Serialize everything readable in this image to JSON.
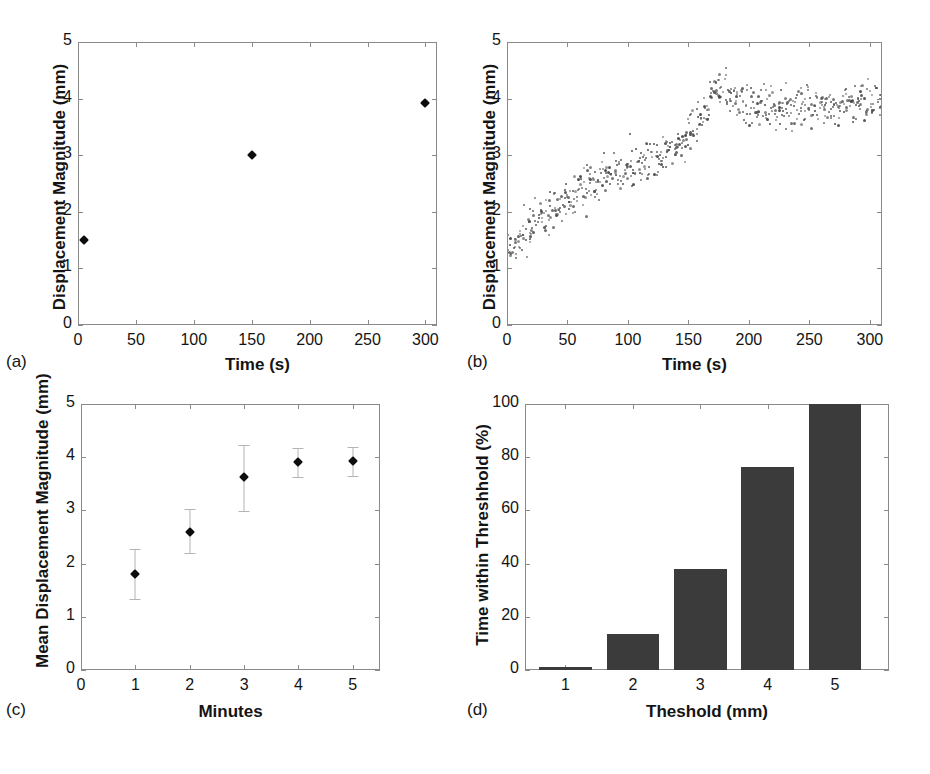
{
  "figure": {
    "width": 930,
    "height": 774,
    "background": "#ffffff",
    "marker_color": "#0d0d0d",
    "errorbar_color": "#b4b4b4",
    "bar_color": "#3b3b3b",
    "axis_color": "#8a8a8a",
    "scatter_color": "#4a4a4a"
  },
  "panels": {
    "a": {
      "letter": "(a)",
      "xlabel": "Time (s)",
      "ylabel": "Displacement Magnitude (mm)",
      "xticks": [
        "0",
        "50",
        "100",
        "150",
        "200",
        "250",
        "300"
      ],
      "yticks": [
        "0",
        "1",
        "2",
        "3",
        "4",
        "5"
      ]
    },
    "b": {
      "letter": "(b)",
      "xlabel": "Time (s)",
      "ylabel": "Displacement Magnitude (mm)",
      "xticks": [
        "0",
        "50",
        "100",
        "150",
        "200",
        "250",
        "300"
      ],
      "yticks": [
        "0",
        "1",
        "2",
        "3",
        "4",
        "5"
      ]
    },
    "c": {
      "letter": "(c)",
      "xlabel": "Minutes",
      "ylabel": "Mean Displacement Magnitude (mm)",
      "xticks": [
        "0",
        "1",
        "2",
        "3",
        "4",
        "5"
      ],
      "yticks": [
        "0",
        "1",
        "2",
        "3",
        "4",
        "5"
      ]
    },
    "d": {
      "letter": "(d)",
      "xlabel": "Theshold (mm)",
      "ylabel": "Time within Threshhold (%)",
      "xticks": [
        "1",
        "2",
        "3",
        "4",
        "5"
      ],
      "yticks": [
        "0",
        "20",
        "40",
        "60",
        "80",
        "100"
      ]
    }
  },
  "chart_data": [
    {
      "id": "a",
      "type": "scatter",
      "title": "",
      "xlabel": "Time (s)",
      "ylabel": "Displacement Magnitude (mm)",
      "xlim": [
        0,
        310
      ],
      "ylim": [
        0,
        5
      ],
      "xticks": [
        0,
        50,
        100,
        150,
        200,
        250,
        300
      ],
      "yticks": [
        0,
        1,
        2,
        3,
        4,
        5
      ],
      "grid": false,
      "legend": null,
      "x": [
        5,
        150,
        300
      ],
      "y": [
        1.5,
        3.01,
        3.92
      ]
    },
    {
      "id": "b",
      "type": "scatter",
      "title": "",
      "xlabel": "Time (s)",
      "ylabel": "Displacement Magnitude (mm)",
      "xlim": [
        0,
        310
      ],
      "ylim": [
        0,
        5
      ],
      "xticks": [
        0,
        50,
        100,
        150,
        200,
        250,
        300
      ],
      "yticks": [
        0,
        1,
        2,
        3,
        4,
        5
      ],
      "grid": false,
      "legend": null,
      "description": "Dense point cloud of per-frame displacement; rises roughly linearly from about 1.4 mm at t=0 to a peak near 4.3 mm at t~170 s, then plateaus in a noisy band between about 3.4 and 4.4 mm out to t~305 s. A few low outliers near 0.3-1.0 mm appear at t<20 s.",
      "trend_x": [
        0,
        20,
        40,
        60,
        80,
        100,
        120,
        140,
        160,
        170,
        180,
        200,
        220,
        240,
        260,
        280,
        305
      ],
      "trend_y": [
        1.45,
        1.8,
        2.1,
        2.45,
        2.6,
        2.8,
        3.0,
        3.2,
        3.6,
        4.3,
        4.15,
        3.85,
        3.9,
        3.85,
        3.9,
        3.95,
        4.0
      ],
      "spread": [
        0.45,
        0.35,
        0.35,
        0.38,
        0.35,
        0.33,
        0.33,
        0.33,
        0.35,
        0.32,
        0.35,
        0.4,
        0.4,
        0.4,
        0.38,
        0.38,
        0.35
      ],
      "n_points": 620
    },
    {
      "id": "c",
      "type": "scatter",
      "title": "",
      "xlabel": "Minutes",
      "ylabel": "Mean Displacement Magnitude (mm)",
      "xlim": [
        0,
        5.5
      ],
      "ylim": [
        0,
        5
      ],
      "xticks": [
        0,
        1,
        2,
        3,
        4,
        5
      ],
      "yticks": [
        0,
        1,
        2,
        3,
        4,
        5
      ],
      "grid": false,
      "legend": null,
      "categories": [
        1,
        2,
        3,
        4,
        5
      ],
      "values": [
        1.8,
        2.6,
        3.62,
        3.91,
        3.93
      ],
      "err_low": [
        1.33,
        2.2,
        2.99,
        3.62,
        3.65
      ],
      "err_high": [
        2.28,
        3.02,
        4.22,
        4.18,
        4.19
      ]
    },
    {
      "id": "d",
      "type": "bar",
      "title": "",
      "xlabel": "Theshold (mm)",
      "ylabel": "Time within Threshhold (%)",
      "xlim": [
        0.4,
        5.8
      ],
      "ylim": [
        0,
        100
      ],
      "xticks": [
        1,
        2,
        3,
        4,
        5
      ],
      "yticks": [
        0,
        20,
        40,
        60,
        80,
        100
      ],
      "grid": false,
      "legend": null,
      "categories": [
        "1",
        "2",
        "3",
        "4",
        "5"
      ],
      "values": [
        1,
        13.5,
        38,
        76.5,
        100
      ]
    }
  ]
}
